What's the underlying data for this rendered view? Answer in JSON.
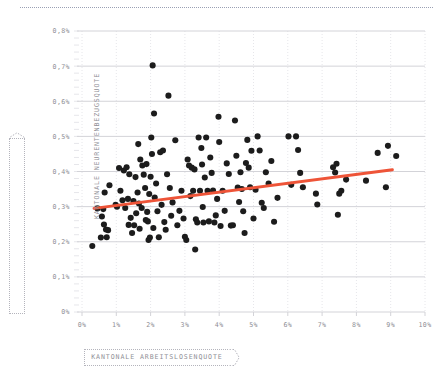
{
  "chart_data": {
    "type": "scatter",
    "title": "",
    "subtitle": "",
    "xlabel": "KANTONALE ARBEITSLOSENQUOTE",
    "ylabel": "KANTONALE NEURENTENBEZUGSQUOTE",
    "xlim": [
      0,
      10
    ],
    "ylim": [
      0,
      0.8
    ],
    "xtick_labels": [
      "0%",
      "1%",
      "2%",
      "3%",
      "4%",
      "5%",
      "6%",
      "7%",
      "8%",
      "9%",
      "10%"
    ],
    "xtick_values": [
      0,
      1,
      2,
      3,
      4,
      5,
      6,
      7,
      8,
      9,
      10
    ],
    "ytick_labels": [
      "0%",
      "0,1%",
      "0,2%",
      "0,3%",
      "0,4%",
      "0,5%",
      "0,6%",
      "0,7%",
      "0,8%"
    ],
    "ytick_values": [
      0,
      0.1,
      0.2,
      0.3,
      0.4,
      0.5,
      0.6,
      0.7,
      0.8
    ],
    "grid": {
      "horizontal": true,
      "vertical": true,
      "minor_y": true
    },
    "legend_position": "none",
    "series": [
      {
        "name": "Kantone",
        "marker": "circle",
        "color": "#1c1c1c",
        "points": [
          [
            0.3,
            0.188
          ],
          [
            0.45,
            0.295
          ],
          [
            0.55,
            0.212
          ],
          [
            0.58,
            0.272
          ],
          [
            0.62,
            0.293
          ],
          [
            0.64,
            0.249
          ],
          [
            0.66,
            0.34
          ],
          [
            0.7,
            0.235
          ],
          [
            0.72,
            0.213
          ],
          [
            0.76,
            0.233
          ],
          [
            0.8,
            0.361
          ],
          [
            0.98,
            0.305
          ],
          [
            1.02,
            0.3
          ],
          [
            1.08,
            0.41
          ],
          [
            1.12,
            0.345
          ],
          [
            1.18,
            0.318
          ],
          [
            1.22,
            0.403
          ],
          [
            1.26,
            0.296
          ],
          [
            1.3,
            0.412
          ],
          [
            1.34,
            0.322
          ],
          [
            1.36,
            0.248
          ],
          [
            1.38,
            0.392
          ],
          [
            1.42,
            0.268
          ],
          [
            1.46,
            0.225
          ],
          [
            1.5,
            0.316
          ],
          [
            1.52,
            0.247
          ],
          [
            1.56,
            0.384
          ],
          [
            1.58,
            0.281
          ],
          [
            1.62,
            0.34
          ],
          [
            1.64,
            0.478
          ],
          [
            1.66,
            0.309
          ],
          [
            1.68,
            0.237
          ],
          [
            1.7,
            0.434
          ],
          [
            1.74,
            0.296
          ],
          [
            1.76,
            0.417
          ],
          [
            1.8,
            0.391
          ],
          [
            1.84,
            0.353
          ],
          [
            1.86,
            0.262
          ],
          [
            1.88,
            0.421
          ],
          [
            1.9,
            0.285
          ],
          [
            1.92,
            0.258
          ],
          [
            1.94,
            0.205
          ],
          [
            1.96,
            0.336
          ],
          [
            1.98,
            0.212
          ],
          [
            2.0,
            0.385
          ],
          [
            2.02,
            0.497
          ],
          [
            2.04,
            0.45
          ],
          [
            2.06,
            0.702
          ],
          [
            2.08,
            0.239
          ],
          [
            2.1,
            0.565
          ],
          [
            2.12,
            0.326
          ],
          [
            2.16,
            0.366
          ],
          [
            2.2,
            0.287
          ],
          [
            2.24,
            0.213
          ],
          [
            2.28,
            0.455
          ],
          [
            2.32,
            0.305
          ],
          [
            2.36,
            0.46
          ],
          [
            2.4,
            0.256
          ],
          [
            2.44,
            0.234
          ],
          [
            2.48,
            0.392
          ],
          [
            2.52,
            0.616
          ],
          [
            2.56,
            0.353
          ],
          [
            2.6,
            0.274
          ],
          [
            2.64,
            0.312
          ],
          [
            2.72,
            0.489
          ],
          [
            2.78,
            0.247
          ],
          [
            2.84,
            0.288
          ],
          [
            2.9,
            0.345
          ],
          [
            2.96,
            0.266
          ],
          [
            3.0,
            0.214
          ],
          [
            3.04,
            0.205
          ],
          [
            3.08,
            0.434
          ],
          [
            3.12,
            0.417
          ],
          [
            3.16,
            0.33
          ],
          [
            3.2,
            0.411
          ],
          [
            3.24,
            0.345
          ],
          [
            3.28,
            0.406
          ],
          [
            3.3,
            0.178
          ],
          [
            3.32,
            0.264
          ],
          [
            3.36,
            0.255
          ],
          [
            3.4,
            0.497
          ],
          [
            3.44,
            0.345
          ],
          [
            3.48,
            0.467
          ],
          [
            3.5,
            0.42
          ],
          [
            3.52,
            0.299
          ],
          [
            3.54,
            0.255
          ],
          [
            3.58,
            0.383
          ],
          [
            3.62,
            0.497
          ],
          [
            3.66,
            0.345
          ],
          [
            3.7,
            0.258
          ],
          [
            3.74,
            0.44
          ],
          [
            3.78,
            0.396
          ],
          [
            3.82,
            0.346
          ],
          [
            3.86,
            0.255
          ],
          [
            3.9,
            0.275
          ],
          [
            3.94,
            0.322
          ],
          [
            3.98,
            0.556
          ],
          [
            4.0,
            0.484
          ],
          [
            4.04,
            0.245
          ],
          [
            4.1,
            0.345
          ],
          [
            4.16,
            0.288
          ],
          [
            4.22,
            0.423
          ],
          [
            4.28,
            0.393
          ],
          [
            4.34,
            0.246
          ],
          [
            4.4,
            0.247
          ],
          [
            4.46,
            0.545
          ],
          [
            4.5,
            0.445
          ],
          [
            4.54,
            0.354
          ],
          [
            4.58,
            0.313
          ],
          [
            4.62,
            0.398
          ],
          [
            4.66,
            0.35
          ],
          [
            4.7,
            0.287
          ],
          [
            4.74,
            0.225
          ],
          [
            4.78,
            0.424
          ],
          [
            4.82,
            0.49
          ],
          [
            4.86,
            0.411
          ],
          [
            4.9,
            0.355
          ],
          [
            4.94,
            0.459
          ],
          [
            5.0,
            0.266
          ],
          [
            5.06,
            0.348
          ],
          [
            5.12,
            0.5
          ],
          [
            5.18,
            0.46
          ],
          [
            5.24,
            0.311
          ],
          [
            5.3,
            0.296
          ],
          [
            5.36,
            0.398
          ],
          [
            5.44,
            0.366
          ],
          [
            5.52,
            0.43
          ],
          [
            5.6,
            0.257
          ],
          [
            5.7,
            0.325
          ],
          [
            6.02,
            0.5
          ],
          [
            6.1,
            0.362
          ],
          [
            6.24,
            0.5
          ],
          [
            6.3,
            0.461
          ],
          [
            6.36,
            0.396
          ],
          [
            6.44,
            0.355
          ],
          [
            6.82,
            0.337
          ],
          [
            6.86,
            0.306
          ],
          [
            7.32,
            0.412
          ],
          [
            7.38,
            0.397
          ],
          [
            7.42,
            0.422
          ],
          [
            7.46,
            0.277
          ],
          [
            7.5,
            0.337
          ],
          [
            7.56,
            0.345
          ],
          [
            7.7,
            0.377
          ],
          [
            8.28,
            0.374
          ],
          [
            8.62,
            0.453
          ],
          [
            8.86,
            0.355
          ],
          [
            8.92,
            0.473
          ],
          [
            9.16,
            0.444
          ]
        ]
      }
    ],
    "trendline": {
      "name": "Regressionsgerade",
      "color": "#ee5438",
      "x_start": 0.35,
      "y_start": 0.295,
      "x_end": 9.05,
      "y_end": 0.405
    }
  },
  "axis_labels": {
    "y_title": "KANTONALE NEURENTENBEZUGSQUOTE",
    "x_title": "KANTONALE ARBEITSLOSENQUOTE"
  },
  "colors": {
    "dot": "#1c1c1c",
    "trend": "#ee5438",
    "gridline_major": "#d3d3d8",
    "gridline_minor": "#e6e6ea",
    "tick_text": "#8e8e95",
    "label_border": "#b4b4bc",
    "top_rule": "#9aa0b4"
  }
}
